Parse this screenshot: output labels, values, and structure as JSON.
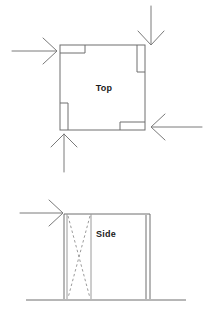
{
  "figure": {
    "background_color": "#ffffff",
    "line_color": "#6f6f6f",
    "label_color": "#1b1b1b",
    "arrow_color": "#7a7a7a",
    "dash_color": "#9a9a9a"
  },
  "views": {
    "top": {
      "label": "Top",
      "label_x": 104,
      "label_y": 91,
      "outline": {
        "x": 60,
        "y": 45,
        "width": 85,
        "height": 85
      },
      "notches": [
        {
          "name": "top-left-notch",
          "orientation": "horizontal",
          "x": 60,
          "y": 45,
          "width": 25,
          "height": 8
        },
        {
          "name": "top-right-notch",
          "orientation": "vertical",
          "x": 137,
          "y": 45,
          "width": 8,
          "height": 27
        },
        {
          "name": "bottom-left-notch",
          "orientation": "vertical",
          "x": 60,
          "y": 103,
          "width": 8,
          "height": 27
        },
        {
          "name": "bottom-right-notch",
          "orientation": "horizontal",
          "x": 120,
          "y": 122,
          "width": 25,
          "height": 8
        }
      ],
      "arrows": [
        {
          "name": "arrow-left",
          "direction": "right",
          "x1": 12,
          "y1": 51,
          "x2": 56,
          "y2": 51
        },
        {
          "name": "arrow-top",
          "direction": "down",
          "x1": 151,
          "y1": 6,
          "x2": 151,
          "y2": 44
        },
        {
          "name": "arrow-right",
          "direction": "left",
          "x1": 202,
          "y1": 127,
          "x2": 152,
          "y2": 127
        },
        {
          "name": "arrow-bottom",
          "direction": "up",
          "x1": 64,
          "y1": 172,
          "x2": 64,
          "y2": 134
        }
      ]
    },
    "side": {
      "label": "Side",
      "label_x": 106,
      "label_y": 237,
      "outline": {
        "x": 64,
        "y": 214,
        "width": 86,
        "height": 85
      },
      "inner_wall_x": 146,
      "brace_panel": {
        "x_left": 67,
        "x_right": 91,
        "y_top": 214,
        "y_bottom": 299
      },
      "ground": {
        "x1": 26,
        "y1": 300,
        "x2": 186,
        "y2": 300
      },
      "arrows": [
        {
          "name": "arrow-side-left",
          "direction": "right",
          "x1": 20,
          "y1": 213,
          "x2": 62,
          "y2": 213
        }
      ]
    }
  }
}
